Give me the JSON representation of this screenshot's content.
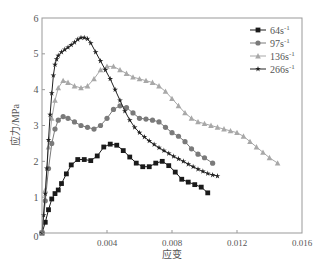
{
  "chart_data": {
    "type": "line",
    "title": "",
    "xlabel": "应变",
    "ylabel": "应力/MPa",
    "xlim": [
      0,
      0.016
    ],
    "ylim": [
      0,
      6
    ],
    "xticks": [
      "0",
      "0.004",
      "0.008",
      "0.012",
      "0.016"
    ],
    "yticks": [
      "0",
      "1",
      "2",
      "3",
      "4",
      "5",
      "6"
    ],
    "grid": false,
    "legend_position": "upper right",
    "series": [
      {
        "name": "64s⁻¹",
        "label_base": "64s",
        "color": "#1a1a1a",
        "marker": "square",
        "x": [
          0.0,
          0.0002,
          0.0004,
          0.0006,
          0.0008,
          0.001,
          0.0012,
          0.0015,
          0.0018,
          0.0022,
          0.0026,
          0.003,
          0.0034,
          0.0038,
          0.0042,
          0.0046,
          0.005,
          0.0054,
          0.0058,
          0.0062,
          0.0066,
          0.007,
          0.0074,
          0.0078,
          0.0082,
          0.0086,
          0.009,
          0.0094,
          0.0098,
          0.0102
        ],
        "y": [
          0.0,
          0.3,
          0.65,
          0.95,
          1.1,
          1.2,
          1.38,
          1.65,
          1.9,
          2.05,
          2.05,
          2.02,
          2.15,
          2.4,
          2.48,
          2.45,
          2.3,
          2.12,
          1.95,
          1.85,
          1.85,
          1.95,
          2.0,
          1.88,
          1.7,
          1.5,
          1.42,
          1.35,
          1.28,
          1.12
        ]
      },
      {
        "name": "97s⁻¹",
        "label_base": "97s",
        "color": "#7a7a7a",
        "marker": "circle",
        "x": [
          0.0,
          0.0002,
          0.0004,
          0.0006,
          0.0008,
          0.001,
          0.0013,
          0.0016,
          0.002,
          0.0024,
          0.0028,
          0.0032,
          0.0036,
          0.004,
          0.0044,
          0.0048,
          0.0052,
          0.0056,
          0.006,
          0.0064,
          0.0068,
          0.0072,
          0.0076,
          0.008,
          0.0084,
          0.0088,
          0.0092,
          0.0096,
          0.01,
          0.0105
        ],
        "y": [
          0.0,
          0.9,
          1.8,
          2.5,
          2.9,
          3.15,
          3.25,
          3.2,
          3.1,
          3.0,
          2.95,
          2.9,
          3.0,
          3.2,
          3.45,
          3.55,
          3.5,
          3.35,
          3.2,
          3.18,
          3.15,
          3.1,
          2.95,
          2.8,
          2.7,
          2.55,
          2.35,
          2.2,
          2.1,
          1.95
        ]
      },
      {
        "name": "136s⁻¹",
        "label_base": "136s",
        "color": "#a8a8a8",
        "marker": "triangle",
        "x": [
          0.0,
          0.0002,
          0.0004,
          0.0006,
          0.0008,
          0.001,
          0.0013,
          0.0016,
          0.002,
          0.0024,
          0.0028,
          0.0032,
          0.0036,
          0.004,
          0.0044,
          0.0048,
          0.0052,
          0.0056,
          0.006,
          0.0064,
          0.0068,
          0.0072,
          0.0076,
          0.008,
          0.0084,
          0.0088,
          0.0092,
          0.0096,
          0.01,
          0.0104,
          0.0108,
          0.0112,
          0.0116,
          0.012,
          0.0124,
          0.0128,
          0.0132,
          0.0136,
          0.014,
          0.0145
        ],
        "y": [
          0.0,
          1.2,
          2.4,
          3.2,
          3.7,
          4.05,
          4.25,
          4.2,
          4.1,
          4.05,
          4.1,
          4.3,
          4.55,
          4.65,
          4.65,
          4.55,
          4.45,
          4.35,
          4.3,
          4.25,
          4.2,
          4.1,
          3.95,
          3.75,
          3.55,
          3.35,
          3.2,
          3.1,
          3.05,
          3.0,
          2.95,
          2.9,
          2.85,
          2.8,
          2.7,
          2.55,
          2.4,
          2.25,
          2.1,
          1.95
        ]
      },
      {
        "name": "266s⁻¹",
        "label_base": "266s",
        "color": "#222222",
        "marker": "star",
        "x": [
          0.0,
          0.0001,
          0.0002,
          0.0003,
          0.0004,
          0.0005,
          0.0006,
          0.0007,
          0.0008,
          0.0009,
          0.001,
          0.0012,
          0.0014,
          0.0016,
          0.0018,
          0.002,
          0.0022,
          0.0024,
          0.0026,
          0.0028,
          0.003,
          0.0033,
          0.0036,
          0.0039,
          0.0042,
          0.0045,
          0.0048,
          0.0051,
          0.0054,
          0.0057,
          0.006,
          0.0063,
          0.0066,
          0.0069,
          0.0072,
          0.0075,
          0.0078,
          0.0081,
          0.0084,
          0.0087,
          0.009,
          0.0093,
          0.0096,
          0.0099,
          0.0102,
          0.0105,
          0.0108
        ],
        "y": [
          0.0,
          0.5,
          1.1,
          1.8,
          2.6,
          3.3,
          3.9,
          4.4,
          4.7,
          4.85,
          4.95,
          5.05,
          5.12,
          5.18,
          5.25,
          5.32,
          5.4,
          5.45,
          5.45,
          5.42,
          5.3,
          5.05,
          4.8,
          4.55,
          4.3,
          4.0,
          3.7,
          3.4,
          3.15,
          2.95,
          2.8,
          2.68,
          2.57,
          2.47,
          2.38,
          2.3,
          2.22,
          2.14,
          2.07,
          2.0,
          1.92,
          1.85,
          1.78,
          1.72,
          1.66,
          1.62,
          1.59
        ]
      }
    ]
  }
}
